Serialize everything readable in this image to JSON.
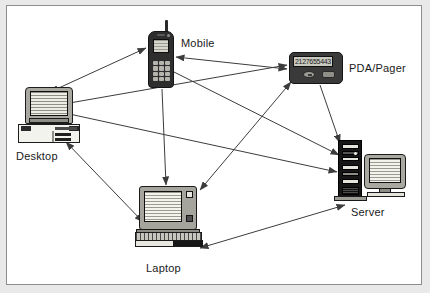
{
  "figure": {
    "kind": "network-topology-diagram",
    "background_color": "#ffffff",
    "frame_border_color": "#8d8d8d",
    "outer_mat_color": "#e9e9e9"
  },
  "nodes": [
    {
      "id": "mobile",
      "label": "Mobile",
      "icon": "mobile-phone-icon",
      "label_position": "right"
    },
    {
      "id": "pda",
      "label": "PDA/Pager",
      "icon": "pda-pager-icon",
      "label_position": "right",
      "screen_text": "2127655443"
    },
    {
      "id": "desktop",
      "label": "Desktop",
      "icon": "desktop-computer-icon",
      "label_position": "below"
    },
    {
      "id": "laptop",
      "label": "Laptop",
      "icon": "laptop-computer-icon",
      "label_position": "below"
    },
    {
      "id": "server",
      "label": "Server",
      "icon": "server-tower-icon",
      "label_position": "below"
    }
  ],
  "edges": [
    {
      "from": "desktop",
      "to": "mobile",
      "direction": "both"
    },
    {
      "from": "desktop",
      "to": "pda",
      "direction": "both"
    },
    {
      "from": "desktop",
      "to": "laptop",
      "direction": "both"
    },
    {
      "from": "desktop",
      "to": "server",
      "direction": "to"
    },
    {
      "from": "mobile",
      "to": "pda",
      "direction": "both"
    },
    {
      "from": "mobile",
      "to": "laptop",
      "direction": "to"
    },
    {
      "from": "mobile",
      "to": "server",
      "direction": "to"
    },
    {
      "from": "pda",
      "to": "laptop",
      "direction": "both"
    },
    {
      "from": "pda",
      "to": "server",
      "direction": "to"
    },
    {
      "from": "laptop",
      "to": "server",
      "direction": "both"
    }
  ],
  "style": {
    "line_color": "#3c3c3c",
    "line_width": 1,
    "arrowhead": "solid-filled-triangle"
  }
}
